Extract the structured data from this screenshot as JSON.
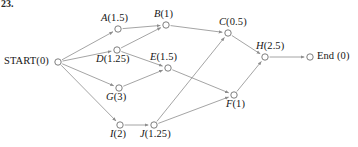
{
  "figure": {
    "tag": "23.",
    "type": "activity-network-diagram",
    "background_color": "#ffffff",
    "edge_color": "#8d8d8d",
    "node_stroke_color": "#6f6f6f",
    "text_color": "#161616"
  },
  "nodes": [
    {
      "id": "START",
      "name": "START",
      "duration": "0",
      "label": "START(0)",
      "shape": "circle",
      "x": 58,
      "y": 62,
      "label_x": 4,
      "label_y": 55,
      "italic": false
    },
    {
      "id": "A",
      "name": "A",
      "duration": "1.5",
      "label": "A(1.5)",
      "shape": "circle",
      "x": 118,
      "y": 29,
      "label_x": 101,
      "label_y": 12,
      "italic": true
    },
    {
      "id": "B",
      "name": "B",
      "duration": "1",
      "label": "B(1)",
      "shape": "circle",
      "x": 166,
      "y": 25,
      "label_x": 154,
      "label_y": 8,
      "italic": true
    },
    {
      "id": "C",
      "name": "C",
      "duration": "0.5",
      "label": "C(0.5)",
      "shape": "circle",
      "x": 228,
      "y": 33,
      "label_x": 219,
      "label_y": 16,
      "italic": true
    },
    {
      "id": "D",
      "name": "D",
      "duration": "1.25",
      "label": "D(1.25)",
      "shape": "circle",
      "x": 117,
      "y": 50,
      "label_x": 96,
      "label_y": 53,
      "italic": true
    },
    {
      "id": "E",
      "name": "E",
      "duration": "1.5",
      "label": "E(1.5)",
      "shape": "circle",
      "x": 168,
      "y": 68,
      "label_x": 150,
      "label_y": 51,
      "italic": true
    },
    {
      "id": "F",
      "name": "F",
      "duration": "1",
      "label": "F(1)",
      "shape": "circle",
      "x": 234,
      "y": 95,
      "label_x": 226,
      "label_y": 98,
      "italic": true
    },
    {
      "id": "G",
      "name": "G",
      "duration": "3",
      "label": "G(3)",
      "shape": "circle",
      "x": 119,
      "y": 88,
      "label_x": 106,
      "label_y": 91,
      "italic": true
    },
    {
      "id": "H",
      "name": "H",
      "duration": "2.5",
      "label": "H(2.5)",
      "shape": "circle",
      "x": 265,
      "y": 57,
      "label_x": 256,
      "label_y": 40,
      "italic": true
    },
    {
      "id": "I",
      "name": "I",
      "duration": "2",
      "label": "I(2)",
      "shape": "circle",
      "x": 120,
      "y": 125,
      "label_x": 110,
      "label_y": 128,
      "italic": true
    },
    {
      "id": "J",
      "name": "J",
      "duration": "1.25",
      "label": "J(1.25)",
      "shape": "circle",
      "x": 154,
      "y": 125,
      "label_x": 140,
      "label_y": 128,
      "italic": true
    },
    {
      "id": "End",
      "name": "End",
      "duration": "0",
      "label": "End (0)",
      "shape": "circle",
      "x": 310,
      "y": 57,
      "label_x": 317,
      "label_y": 50,
      "italic": false
    }
  ],
  "edges": [
    {
      "from": "START",
      "to": "A"
    },
    {
      "from": "START",
      "to": "D"
    },
    {
      "from": "START",
      "to": "G"
    },
    {
      "from": "START",
      "to": "I"
    },
    {
      "from": "A",
      "to": "B"
    },
    {
      "from": "D",
      "to": "B"
    },
    {
      "from": "D",
      "to": "E"
    },
    {
      "from": "G",
      "to": "E"
    },
    {
      "from": "B",
      "to": "C"
    },
    {
      "from": "J",
      "to": "C"
    },
    {
      "from": "E",
      "to": "F"
    },
    {
      "from": "J",
      "to": "F"
    },
    {
      "from": "I",
      "to": "J"
    },
    {
      "from": "C",
      "to": "H"
    },
    {
      "from": "F",
      "to": "H"
    },
    {
      "from": "H",
      "to": "End"
    }
  ]
}
